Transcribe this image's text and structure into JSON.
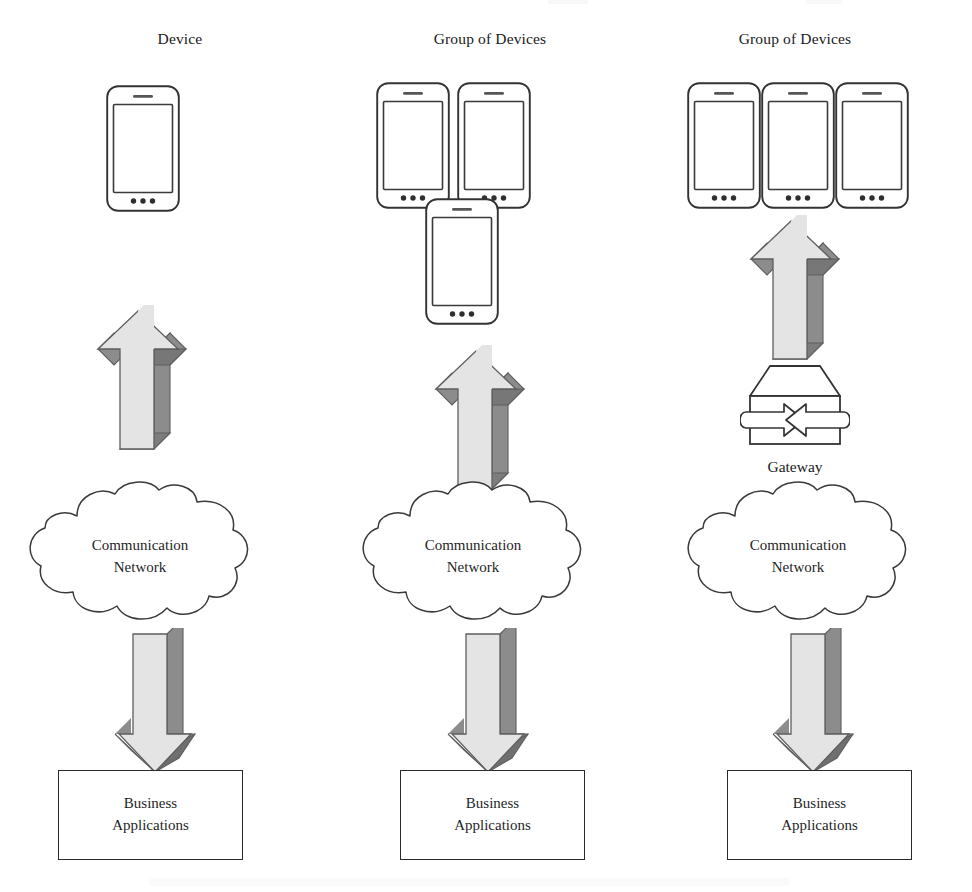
{
  "diagram": {
    "type": "architecture-diagram",
    "columns": [
      {
        "id": "single-device",
        "header": "Device",
        "device_count": 1,
        "device_layout": "single",
        "has_gateway": false,
        "cloud_label_line1": "Communication",
        "cloud_label_line2": "Network",
        "box_label_line1": "Business",
        "box_label_line2": "Applications",
        "arrow_up_direction": "up",
        "arrow_down_direction": "down"
      },
      {
        "id": "group-direct",
        "header": "Group of Devices",
        "device_count": 3,
        "device_layout": "triangle",
        "has_gateway": false,
        "cloud_label_line1": "Communication",
        "cloud_label_line2": "Network",
        "box_label_line1": "Business",
        "box_label_line2": "Applications",
        "arrow_up_direction": "up",
        "arrow_down_direction": "down"
      },
      {
        "id": "group-gateway",
        "header": "Group of Devices",
        "device_count": 3,
        "device_layout": "row",
        "has_gateway": true,
        "gateway_label": "Gateway",
        "cloud_label_line1": "Communication",
        "cloud_label_line2": "Network",
        "box_label_line1": "Business",
        "box_label_line2": "Applications",
        "arrow_up_direction": "up",
        "arrow_down_direction": "down"
      }
    ],
    "colors": {
      "stroke": "#2a2a2a",
      "arrow_face": "#e2e2e2",
      "arrow_shade": "#8f8f8f",
      "arrow_shade_dark": "#7b7b7b",
      "background": "#ffffff",
      "text": "#1f1f1f"
    }
  }
}
